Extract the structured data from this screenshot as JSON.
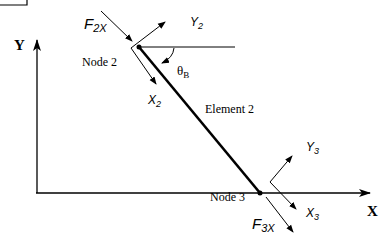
{
  "axes": {
    "x_label": "X",
    "y_label": "Y"
  },
  "nodes": [
    {
      "label": "Node 2",
      "local_x": "X",
      "local_x_sub": "2",
      "local_y": "Y",
      "local_y_sub": "2",
      "force": "F",
      "force_sub": "2X"
    },
    {
      "label": "Node 3",
      "local_x": "X",
      "local_x_sub": "3",
      "local_y": "Y",
      "local_y_sub": "3",
      "force": "F",
      "force_sub": "3X"
    }
  ],
  "element": {
    "label": "Element 2"
  },
  "angle": {
    "symbol": "θ",
    "sub": "B"
  },
  "colors": {
    "stroke": "#000000",
    "background": "#ffffff"
  }
}
